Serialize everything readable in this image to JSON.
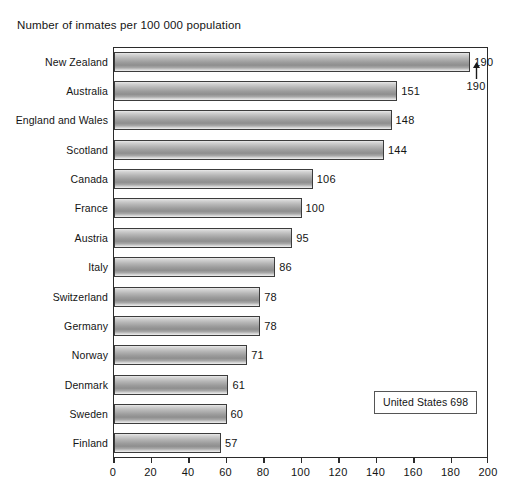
{
  "chart_data": {
    "type": "bar",
    "orientation": "horizontal",
    "title": "Number of inmates per 100 000 population",
    "xlabel": "",
    "ylabel": "",
    "xlim": [
      0,
      200
    ],
    "xticks": [
      0,
      20,
      40,
      60,
      80,
      100,
      120,
      140,
      160,
      180,
      200
    ],
    "grid": false,
    "legend": null,
    "categories": [
      "New Zealand",
      "Australia",
      "England and Wales",
      "Scotland",
      "Canada",
      "France",
      "Austria",
      "Italy",
      "Switzerland",
      "Germany",
      "Norway",
      "Denmark",
      "Sweden",
      "Finland"
    ],
    "values": [
      190,
      151,
      148,
      144,
      106,
      100,
      95,
      86,
      78,
      78,
      71,
      61,
      60,
      57
    ],
    "value_labels": [
      "190",
      "151",
      "148",
      "144",
      "106",
      "100",
      "95",
      "86",
      "78",
      "78",
      "71",
      "61",
      "60",
      "57"
    ],
    "annotations": [
      {
        "name": "overflow-value-newzealand",
        "text": "190",
        "arrow": "up",
        "target_category": "New Zealand"
      },
      {
        "name": "united-states-callout",
        "text": "United States 698"
      }
    ],
    "colors": {
      "bar_light": "#e9e9e9",
      "bar_mid": "#9c9c9c",
      "bar_dark": "#8e8e8e",
      "bar_border": "#3c3c3c",
      "axis": "#2b2b2b",
      "text": "#141414",
      "background": "#ffffff"
    }
  },
  "callout": {
    "label": "United States 698"
  },
  "overflow": {
    "value": "190",
    "arrow_icon": "arrow-up-icon"
  }
}
